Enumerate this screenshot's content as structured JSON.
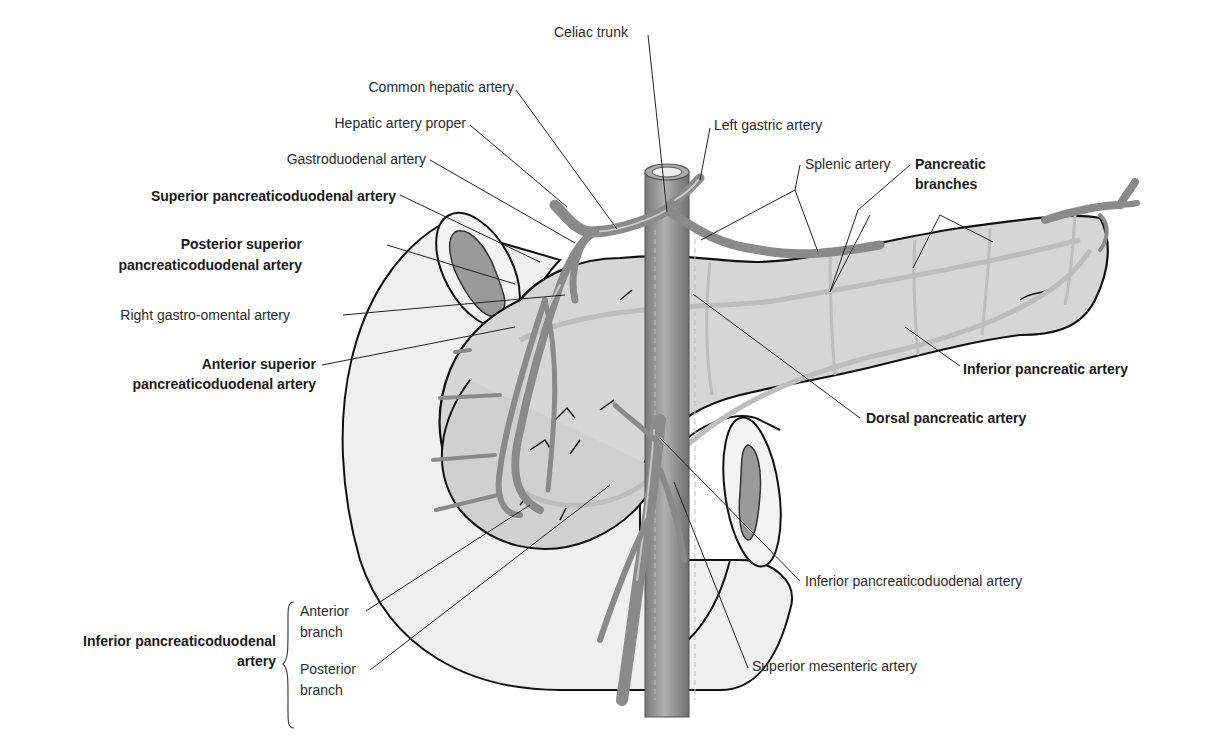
{
  "figure": {
    "type": "anatomical-diagram"
  },
  "labels": {
    "celiac_trunk": "Celiac trunk",
    "common_hepatic_artery": "Common hepatic artery",
    "left_gastric_artery": "Left gastric artery",
    "hepatic_artery_proper": "Hepatic artery proper",
    "gastroduodenal_artery": "Gastroduodenal artery",
    "splenic_artery": "Splenic artery",
    "pancreatic_branches_1": "Pancreatic",
    "pancreatic_branches_2": "branches",
    "superior_pancreaticoduodenal_artery": "Superior pancreaticoduodenal artery",
    "posterior_superior_1": "Posterior superior",
    "posterior_superior_2": "pancreaticoduodenal artery",
    "right_gastro_omental_artery": "Right gastro-omental artery",
    "anterior_superior_1": "Anterior superior",
    "anterior_superior_2": "pancreaticoduodenal artery",
    "inferior_pancreatic_artery": "Inferior pancreatic artery",
    "dorsal_pancreatic_artery": "Dorsal pancreatic artery",
    "inferior_pancreaticoduodenal_artery_right": "Inferior pancreaticoduodenal artery",
    "superior_mesenteric_artery": "Superior mesenteric artery",
    "inferior_pd_group_1": "Inferior pancreaticoduodenal",
    "inferior_pd_group_2": "artery",
    "anterior_branch_1": "Anterior",
    "anterior_branch_2": "branch",
    "posterior_branch_1": "Posterior",
    "posterior_branch_2": "branch"
  },
  "colors": {
    "organ_fill": "#d9d9d9",
    "duodenum_fill": "#eeeeee",
    "artery": "#8c8c8c",
    "artery_highlight": "#c8c8c8",
    "outline": "#111111",
    "leader": "#222222"
  }
}
